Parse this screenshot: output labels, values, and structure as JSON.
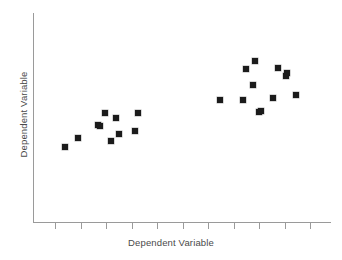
{
  "chart_data": {
    "type": "scatter",
    "title": "",
    "xlabel": "Dependent Variable",
    "ylabel": "Dependent Variable",
    "grid": false,
    "legend": null,
    "axis_tick_labels": {
      "x": [],
      "y": []
    },
    "axis_pixel_frame": {
      "x_axis_left_px": 33,
      "x_axis_right_px": 331,
      "x_axis_y_px": 222,
      "y_axis_top_px": 13,
      "y_axis_bottom_px": 222
    },
    "x_tick_positions_px": [
      55,
      81,
      106,
      132,
      157,
      183,
      208,
      234,
      259,
      285,
      310
    ],
    "marker": {
      "shape": "square",
      "size_px": 6,
      "color": "#1b1b1b"
    },
    "series": [
      {
        "name": "observations",
        "points_px": [
          [
            65,
            147
          ],
          [
            78,
            138
          ],
          [
            98,
            125
          ],
          [
            100,
            126
          ],
          [
            105,
            113
          ],
          [
            111,
            141
          ],
          [
            116,
            118
          ],
          [
            119,
            134
          ],
          [
            135,
            131
          ],
          [
            138,
            113
          ],
          [
            220,
            100
          ],
          [
            243,
            100
          ],
          [
            246,
            69
          ],
          [
            253,
            85
          ],
          [
            255,
            61
          ],
          [
            259,
            112
          ],
          [
            261,
            111
          ],
          [
            273,
            98
          ],
          [
            278,
            68
          ],
          [
            286,
            76
          ],
          [
            287,
            73
          ],
          [
            296,
            95
          ]
        ]
      }
    ]
  },
  "colors": {
    "marker": "#1b1b1b",
    "axis": "#9a9a9a",
    "label_text": "#4a4a4a",
    "background": "#ffffff"
  }
}
